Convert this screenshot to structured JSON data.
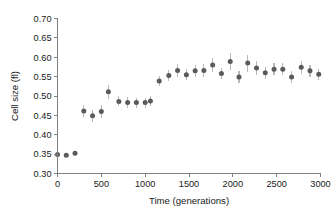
{
  "chart_data": {
    "type": "scatter",
    "title": "",
    "xlabel": "Time (generations)",
    "ylabel": "Cell size (fl)",
    "xlim": [
      0,
      3000
    ],
    "ylim": [
      0.3,
      0.7
    ],
    "xticks": [
      0,
      500,
      1000,
      1500,
      2000,
      2500,
      3000
    ],
    "xtick_labels": [
      "0",
      "500",
      "1000",
      "1500",
      "2000",
      "2500",
      "3000"
    ],
    "yticks": [
      0.3,
      0.35,
      0.4,
      0.45,
      0.5,
      0.55,
      0.6,
      0.65,
      0.7
    ],
    "ytick_labels": [
      "0.30",
      "0.35",
      "0.40",
      "0.45",
      "0.50",
      "0.55",
      "0.60",
      "0.65",
      "0.70"
    ],
    "grid": false,
    "legend": null,
    "marker_color": "#5a5a5a",
    "errorbar_color": "#b9b9b9",
    "series": [
      {
        "name": "Cell size",
        "x": [
          0,
          100,
          200,
          300,
          400,
          500,
          580,
          700,
          800,
          900,
          1000,
          1060,
          1160,
          1270,
          1370,
          1470,
          1570,
          1670,
          1770,
          1870,
          1970,
          2070,
          2170,
          2270,
          2370,
          2470,
          2570,
          2670,
          2780,
          2880,
          2980
        ],
        "y": [
          0.349,
          0.347,
          0.352,
          0.461,
          0.449,
          0.46,
          0.511,
          0.486,
          0.483,
          0.483,
          0.483,
          0.487,
          0.539,
          0.553,
          0.566,
          0.555,
          0.565,
          0.566,
          0.58,
          0.558,
          0.589,
          0.549,
          0.585,
          0.572,
          0.56,
          0.569,
          0.569,
          0.549,
          0.574,
          0.565,
          0.556
        ],
        "yerr": [
          0.004,
          0.004,
          0.005,
          0.016,
          0.016,
          0.017,
          0.018,
          0.013,
          0.014,
          0.013,
          0.013,
          0.013,
          0.013,
          0.014,
          0.017,
          0.014,
          0.015,
          0.016,
          0.019,
          0.015,
          0.021,
          0.015,
          0.022,
          0.019,
          0.015,
          0.016,
          0.016,
          0.015,
          0.017,
          0.015,
          0.014
        ]
      }
    ]
  }
}
